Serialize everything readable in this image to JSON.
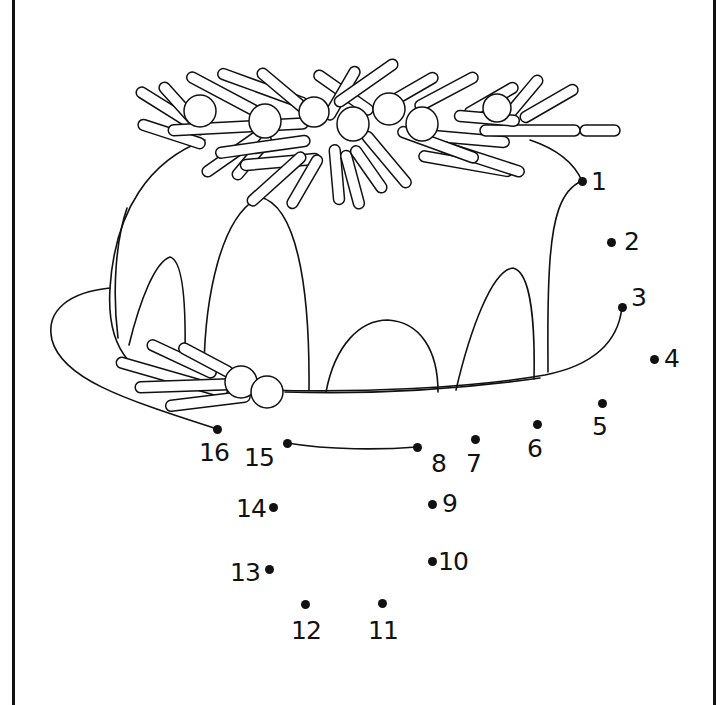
{
  "worksheet": {
    "type": "dot-to-dot",
    "subject": "bundt cake with pine wreath and berries on a plate",
    "line_color": "#111111",
    "background": "#ffffff"
  },
  "dots": [
    {
      "n": "1",
      "x": 582,
      "y": 181,
      "lx": 591,
      "ly": 169
    },
    {
      "n": "2",
      "x": 611,
      "y": 242,
      "lx": 624,
      "ly": 229
    },
    {
      "n": "3",
      "x": 622,
      "y": 307,
      "lx": 631,
      "ly": 285
    },
    {
      "n": "4",
      "x": 654,
      "y": 359,
      "lx": 664,
      "ly": 346
    },
    {
      "n": "5",
      "x": 602,
      "y": 403,
      "lx": 592,
      "ly": 414
    },
    {
      "n": "6",
      "x": 537,
      "y": 424,
      "lx": 527,
      "ly": 436
    },
    {
      "n": "7",
      "x": 475,
      "y": 439,
      "lx": 466,
      "ly": 451
    },
    {
      "n": "8",
      "x": 417,
      "y": 447,
      "lx": 431,
      "ly": 451
    },
    {
      "n": "9",
      "x": 432,
      "y": 504,
      "lx": 442,
      "ly": 491
    },
    {
      "n": "10",
      "x": 432,
      "y": 561,
      "lx": 438,
      "ly": 549
    },
    {
      "n": "11",
      "x": 382,
      "y": 603,
      "lx": 368,
      "ly": 618
    },
    {
      "n": "12",
      "x": 305,
      "y": 604,
      "lx": 291,
      "ly": 618
    },
    {
      "n": "13",
      "x": 269,
      "y": 569,
      "lx": 230,
      "ly": 560
    },
    {
      "n": "14",
      "x": 273,
      "y": 507,
      "lx": 236,
      "ly": 496
    },
    {
      "n": "15",
      "x": 287,
      "y": 443,
      "lx": 244,
      "ly": 445
    },
    {
      "n": "16",
      "x": 217,
      "y": 429,
      "lx": 199,
      "ly": 440
    }
  ]
}
